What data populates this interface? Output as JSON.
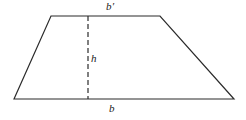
{
  "figure": {
    "type": "trapezoid-diagram",
    "background_color": "#ffffff",
    "stroke_color": "#2b2b2b",
    "labels": {
      "top_base": "b′",
      "height": "h",
      "bottom_base": "b"
    },
    "geometry": {
      "bottom_left": [
        14,
        99
      ],
      "top_left": [
        51,
        16
      ],
      "top_right": [
        160,
        16
      ],
      "bottom_right": [
        234,
        99
      ],
      "height_line_x": 88,
      "height_line_top_y": 16,
      "height_line_bottom_y": 99,
      "height_line_style": "dashed"
    }
  }
}
